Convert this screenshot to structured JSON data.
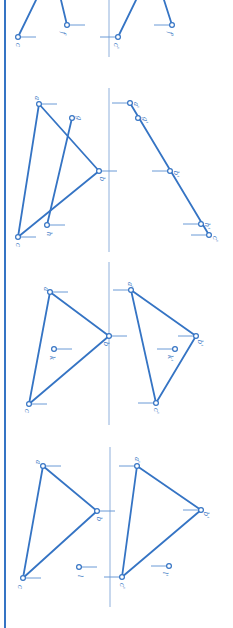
{
  "colors": {
    "line": "#3574c4",
    "tick": "#6a9ad6",
    "axis": "#8fb0dc",
    "border": "#3574c4",
    "point_fill": "#ffffff"
  },
  "border": {
    "x": 5,
    "y1": 0,
    "y2": 628
  },
  "panels": [
    {
      "id": "panel-1",
      "axis": {
        "x": 109,
        "y1": 0,
        "y2": 57
      },
      "segments": [
        {
          "from": [
            18,
            37
          ],
          "to": [
            36,
            0
          ]
        },
        {
          "from": [
            67,
            25
          ],
          "to": [
            61,
            0
          ]
        },
        {
          "from": [
            118,
            37
          ],
          "to": [
            136,
            0
          ]
        },
        {
          "from": [
            172,
            25
          ],
          "to": [
            164,
            0
          ]
        }
      ],
      "points": [
        {
          "name": "c",
          "x": 18,
          "y": 37,
          "tick": "right",
          "label_dx": 0,
          "label_dy": 8
        },
        {
          "name": "f",
          "x": 67,
          "y": 25,
          "tick": "right",
          "label_dx": -4,
          "label_dy": 8
        },
        {
          "name": "c'",
          "x": 118,
          "y": 37,
          "tick": "left",
          "label_dx": -2,
          "label_dy": 9
        },
        {
          "name": "f'",
          "x": 172,
          "y": 25,
          "tick": "left",
          "label_dx": -2,
          "label_dy": 9
        }
      ]
    },
    {
      "id": "panel-2",
      "axis": {
        "x": 109,
        "y1": 88,
        "y2": 252
      },
      "segments": [
        {
          "from": [
            39,
            104
          ],
          "to": [
            99,
            171
          ]
        },
        {
          "from": [
            99,
            171
          ],
          "to": [
            18,
            237
          ]
        },
        {
          "from": [
            18,
            237
          ],
          "to": [
            39,
            104
          ]
        },
        {
          "from": [
            72,
            118
          ],
          "to": [
            47,
            225
          ]
        },
        {
          "from": [
            130,
            103
          ],
          "to": [
            209,
            235
          ]
        }
      ],
      "points": [
        {
          "name": "a",
          "x": 39,
          "y": 104,
          "tick": "right",
          "label_dx": -2,
          "label_dy": -6
        },
        {
          "name": "g",
          "x": 72,
          "y": 118,
          "tick": "none",
          "label_dx": 7,
          "label_dy": 0
        },
        {
          "name": "b",
          "x": 99,
          "y": 171,
          "tick": "right",
          "label_dx": 3,
          "label_dy": 8
        },
        {
          "name": "h",
          "x": 47,
          "y": 225,
          "tick": "right",
          "label_dx": 2,
          "label_dy": 9
        },
        {
          "name": "c",
          "x": 18,
          "y": 237,
          "tick": "right",
          "label_dx": 0,
          "label_dy": 8
        },
        {
          "name": "a'",
          "x": 130,
          "y": 103,
          "tick": "left",
          "label_dx": 6,
          "label_dy": 2
        },
        {
          "name": "g'",
          "x": 138,
          "y": 118,
          "tick": "none",
          "label_dx": 7,
          "label_dy": 2
        },
        {
          "name": "b'",
          "x": 170,
          "y": 171,
          "tick": "left",
          "label_dx": 6,
          "label_dy": 3
        },
        {
          "name": "h'",
          "x": 201,
          "y": 224,
          "tick": "left",
          "label_dx": 6,
          "label_dy": 2
        },
        {
          "name": "c'",
          "x": 209,
          "y": 235,
          "tick": "left",
          "label_dx": 6,
          "label_dy": 4
        }
      ]
    },
    {
      "id": "panel-3",
      "axis": {
        "x": 109,
        "y1": 262,
        "y2": 425
      },
      "segments": [
        {
          "from": [
            50,
            292
          ],
          "to": [
            109,
            336
          ]
        },
        {
          "from": [
            109,
            336
          ],
          "to": [
            29,
            404
          ]
        },
        {
          "from": [
            29,
            404
          ],
          "to": [
            50,
            292
          ]
        },
        {
          "from": [
            131,
            290
          ],
          "to": [
            196,
            336
          ]
        },
        {
          "from": [
            196,
            336
          ],
          "to": [
            156,
            403
          ]
        },
        {
          "from": [
            156,
            403
          ],
          "to": [
            131,
            290
          ]
        }
      ],
      "points": [
        {
          "name": "a",
          "x": 50,
          "y": 292,
          "tick": "right",
          "label_dx": -4,
          "label_dy": -3
        },
        {
          "name": "b",
          "x": 109,
          "y": 336,
          "tick": "right",
          "label_dx": -3,
          "label_dy": 8
        },
        {
          "name": "k",
          "x": 54,
          "y": 349,
          "tick": "right",
          "label_dx": -2,
          "label_dy": 9
        },
        {
          "name": "c",
          "x": 29,
          "y": 404,
          "tick": "right",
          "label_dx": -2,
          "label_dy": 7
        },
        {
          "name": "a'",
          "x": 131,
          "y": 290,
          "tick": "left",
          "label_dx": -1,
          "label_dy": -5
        },
        {
          "name": "b'",
          "x": 196,
          "y": 336,
          "tick": "left",
          "label_dx": 4,
          "label_dy": 7
        },
        {
          "name": "k'",
          "x": 175,
          "y": 349,
          "tick": "left",
          "label_dx": -5,
          "label_dy": 9
        },
        {
          "name": "c'",
          "x": 156,
          "y": 403,
          "tick": "left",
          "label_dx": 0,
          "label_dy": 8
        }
      ]
    },
    {
      "id": "panel-4",
      "axis": {
        "x": 110,
        "y1": 447,
        "y2": 607
      },
      "segments": [
        {
          "from": [
            43,
            466
          ],
          "to": [
            97,
            511
          ]
        },
        {
          "from": [
            97,
            511
          ],
          "to": [
            23,
            578
          ]
        },
        {
          "from": [
            23,
            578
          ],
          "to": [
            43,
            466
          ]
        },
        {
          "from": [
            137,
            466
          ],
          "to": [
            201,
            510
          ]
        },
        {
          "from": [
            201,
            510
          ],
          "to": [
            122,
            577
          ]
        },
        {
          "from": [
            122,
            577
          ],
          "to": [
            137,
            466
          ]
        }
      ],
      "points": [
        {
          "name": "a",
          "x": 43,
          "y": 466,
          "tick": "right",
          "label_dx": -5,
          "label_dy": -4
        },
        {
          "name": "b",
          "x": 97,
          "y": 511,
          "tick": "right",
          "label_dx": 2,
          "label_dy": 8
        },
        {
          "name": "l",
          "x": 79,
          "y": 567,
          "tick": "right",
          "label_dx": 1,
          "label_dy": 9
        },
        {
          "name": "c",
          "x": 23,
          "y": 578,
          "tick": "right",
          "label_dx": -3,
          "label_dy": 9
        },
        {
          "name": "a'",
          "x": 137,
          "y": 466,
          "tick": "left",
          "label_dx": 0,
          "label_dy": -6
        },
        {
          "name": "b'",
          "x": 201,
          "y": 510,
          "tick": "left",
          "label_dx": 5,
          "label_dy": 5
        },
        {
          "name": "l'",
          "x": 169,
          "y": 566,
          "tick": "left",
          "label_dx": -4,
          "label_dy": 8
        },
        {
          "name": "c'",
          "x": 122,
          "y": 577,
          "tick": "left",
          "label_dx": 0,
          "label_dy": 9
        }
      ]
    }
  ]
}
